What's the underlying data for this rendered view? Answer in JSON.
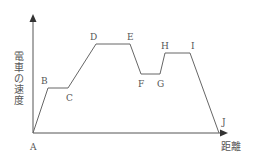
{
  "diagram": {
    "y_axis_label": "電車の速度",
    "y_axis_chars": [
      "電",
      "車",
      "の",
      "速",
      "度"
    ],
    "x_axis_label": "距離",
    "points": [
      {
        "label": "A",
        "x": 33,
        "y": 133
      },
      {
        "label": "B",
        "x": 48,
        "y": 88
      },
      {
        "label": "C",
        "x": 68,
        "y": 88
      },
      {
        "label": "D",
        "x": 96,
        "y": 44
      },
      {
        "label": "E",
        "x": 130,
        "y": 44
      },
      {
        "label": "F",
        "x": 141,
        "y": 74
      },
      {
        "label": "G",
        "x": 160,
        "y": 74
      },
      {
        "label": "H",
        "x": 165,
        "y": 53
      },
      {
        "label": "I",
        "x": 190,
        "y": 53
      },
      {
        "label": "J",
        "x": 219,
        "y": 133
      }
    ],
    "colors": {
      "line": "#666666",
      "text": "#555555",
      "background": "#ffffff"
    }
  }
}
